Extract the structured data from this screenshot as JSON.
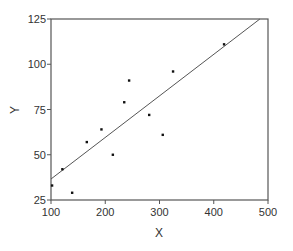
{
  "chart_data": {
    "type": "scatter",
    "title": "",
    "xlabel": "X",
    "ylabel": "Y",
    "xlim": [
      100,
      500
    ],
    "ylim": [
      25,
      125
    ],
    "xticks": [
      100,
      200,
      300,
      400,
      500
    ],
    "yticks": [
      25,
      50,
      75,
      100,
      125
    ],
    "grid": false,
    "legend": null,
    "series": [
      {
        "name": "data",
        "type": "scatter",
        "x": [
          102,
          121,
          139,
          166,
          193,
          214,
          235,
          244,
          281,
          306,
          325,
          419
        ],
        "y": [
          33,
          42,
          29,
          57,
          64,
          50,
          79,
          91,
          72,
          61,
          96,
          111
        ]
      },
      {
        "name": "fit line",
        "type": "line",
        "x": [
          100,
          485
        ],
        "y": [
          36.6,
          125
        ]
      }
    ]
  },
  "colors": {
    "axis": "#555555",
    "points": "#111111",
    "line": "#555555"
  }
}
